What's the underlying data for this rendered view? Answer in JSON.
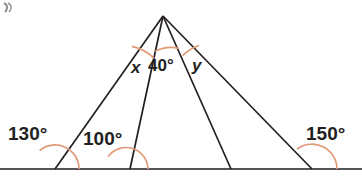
{
  "figure": {
    "name": "angles-in-triangles-diagram",
    "canvas": {
      "width": 362,
      "height": 177,
      "background": "#ffffff"
    },
    "colors": {
      "line": "#231f20",
      "arc": "#e09a78",
      "baseline": "#555558",
      "text": "#231f20"
    },
    "corner_mark": ")",
    "apex": {
      "x": 163,
      "y": 16
    },
    "baseline": {
      "y": 169,
      "x_start": 0,
      "x_end": 362
    },
    "base_points": [
      {
        "name": "A",
        "x": 55,
        "y": 169
      },
      {
        "name": "B",
        "x": 130,
        "y": 169
      },
      {
        "name": "C",
        "x": 231,
        "y": 169
      },
      {
        "name": "D",
        "x": 312,
        "y": 169
      }
    ],
    "rays": [
      {
        "name": "apex-to-A",
        "from": "apex",
        "to": "A"
      },
      {
        "name": "apex-to-B",
        "from": "apex",
        "to": "B"
      },
      {
        "name": "apex-to-C",
        "from": "apex",
        "to": "C"
      },
      {
        "name": "apex-to-D",
        "from": "apex",
        "to": "D"
      }
    ],
    "labels": {
      "angle_130": "130°",
      "angle_100": "100°",
      "angle_150": "150°",
      "angle_x": "x",
      "angle_40": "40°",
      "angle_y": "y"
    },
    "arcs": [
      {
        "name": "arc-130",
        "label": "130°",
        "vertex": "A",
        "radius": 24
      },
      {
        "name": "arc-100",
        "label": "100°",
        "vertex": "B",
        "radius": 22
      },
      {
        "name": "arc-150",
        "label": "150°",
        "vertex": "D",
        "radius": 25
      },
      {
        "name": "arc-x",
        "label": "x",
        "vertex": "apex",
        "radius": 44
      },
      {
        "name": "arc-40",
        "label": "40°",
        "vertex": "apex",
        "radius": 36
      },
      {
        "name": "arc-y",
        "label": "y",
        "vertex": "apex",
        "radius": 44
      }
    ]
  }
}
